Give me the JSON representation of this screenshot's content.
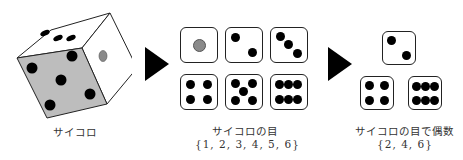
{
  "panels": [
    {
      "id": "die",
      "caption": "サイコロ"
    },
    {
      "id": "outcomes",
      "caption": "サイコロの目",
      "set": "{1, 2, 3, 4, 5, 6}",
      "faces": [
        1,
        2,
        3,
        4,
        5,
        6
      ]
    },
    {
      "id": "even",
      "caption": "サイコロの目で偶数",
      "set": "{2, 4, 6}",
      "faces": [
        2,
        4,
        6
      ]
    }
  ],
  "arrows": [
    "arrow-1",
    "arrow-2"
  ],
  "colors": {
    "face": "#ffffff",
    "shaded_face": "#bdbdbd",
    "pip": "#000000",
    "one_pip": "#8a8a8a"
  }
}
